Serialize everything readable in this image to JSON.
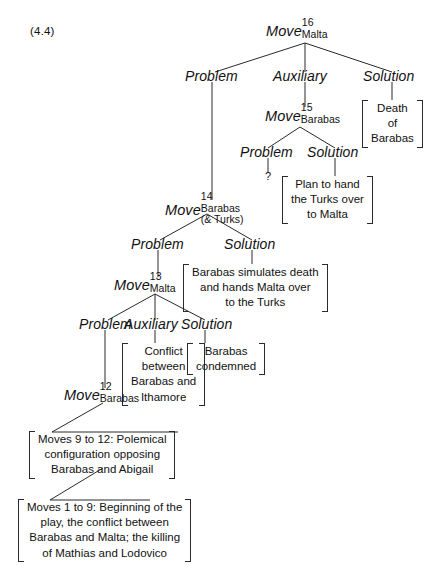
{
  "figure": {
    "number": "(4.4)",
    "type": "tree-diagram"
  },
  "nodes": {
    "move16": {
      "word": "Move",
      "superscript": "16",
      "subscript": "Malta"
    },
    "move15": {
      "word": "Move",
      "superscript": "15",
      "subscript": "Barabas"
    },
    "move14": {
      "word": "Move",
      "superscript": "14",
      "subscript": "Barabas",
      "subscript2": "(& Turks)"
    },
    "move13": {
      "word": "Move",
      "superscript": "13",
      "subscript": "Malta"
    },
    "move12": {
      "word": "Move",
      "superscript": "12",
      "subscript": "Barabas"
    }
  },
  "roles": {
    "problem": "Problem",
    "auxiliary": "Auxiliary",
    "solution": "Solution",
    "unknown": "?"
  },
  "level16": {
    "problem": "Problem",
    "auxiliary": "Auxiliary",
    "solution": "Solution"
  },
  "level15": {
    "problem": "Problem",
    "solution": "Solution"
  },
  "level14": {
    "problem": "Problem",
    "solution": "Solution"
  },
  "level13": {
    "problem": "Problem",
    "auxiliary": "Auxiliary",
    "solution": "Solution"
  },
  "boxes": {
    "death_of_barabas": [
      "Death",
      "of",
      "Barabas"
    ],
    "plan_to_hand": [
      "Plan to hand",
      "the Turks over",
      "to Malta"
    ],
    "simulates_death": [
      "Barabas simulates death",
      "and hands Malta over",
      "to the Turks"
    ],
    "conflict": [
      "Conflict",
      "between",
      "Barabas and",
      "Ithamore"
    ],
    "condemned": [
      "Barabas",
      "condemned"
    ],
    "moves_9_to_12": [
      "Moves 9 to 12:  Polemical",
      "configuration opposing",
      "Barabas and Abigail"
    ],
    "moves_1_to_9": [
      "Moves 1 to 9:  Beginning of the",
      "play, the conflict between",
      "Barabas and Malta; the killing",
      "of Mathias and Lodovico"
    ]
  },
  "colors": {
    "ink": "#2a2a2a",
    "paper": "#ffffff"
  }
}
